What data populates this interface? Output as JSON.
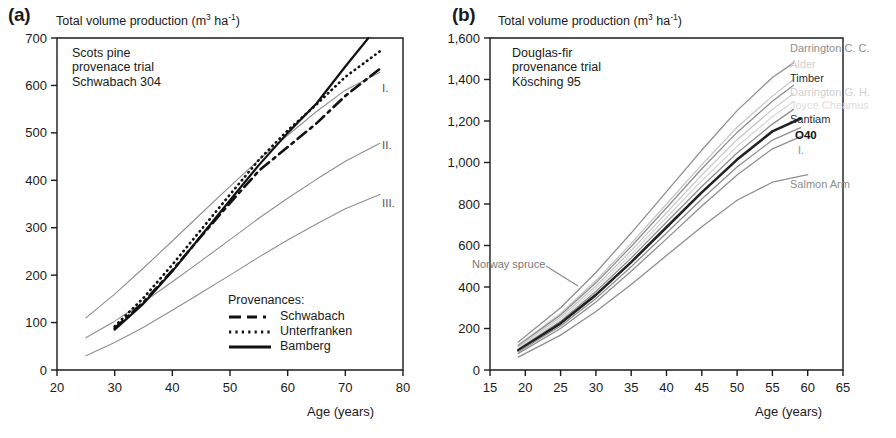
{
  "figure": {
    "background": "#ffffff",
    "axis_color": "#1a1a1a",
    "grey_series_color": "#9a9a9a",
    "dark_series_color": "#1a1a1a"
  },
  "panel_a": {
    "letter": "(a)",
    "axis_title_prefix": "Total volume production (m",
    "axis_title_sup1": "3",
    "axis_title_mid": " ha",
    "axis_title_sup2": "-1",
    "axis_title_suffix": ")",
    "note": "Scots pine\nprovenace trial\nSchwabach 304",
    "xlabel": "Age (years)",
    "yticks": [
      "0",
      "100",
      "200",
      "300",
      "400",
      "500",
      "600",
      "700"
    ],
    "xticks": [
      "20",
      "30",
      "40",
      "50",
      "60",
      "70",
      "80"
    ],
    "yield_class_labels": [
      "I.",
      "II.",
      "III."
    ],
    "legend": {
      "title": "Provenances:",
      "items": [
        {
          "label": "Schwabach",
          "style": "dashdot"
        },
        {
          "label": "Unterfranken",
          "style": "dotted"
        },
        {
          "label": "Bamberg",
          "style": "solid"
        }
      ]
    },
    "chart_data": {
      "type": "line",
      "title": "Scots pine provenace trial Schwabach 304",
      "xlabel": "Age (years)",
      "ylabel": "Total volume production (m3 ha-1)",
      "xlim": [
        20,
        80
      ],
      "ylim": [
        0,
        700
      ],
      "xticks": [
        20,
        30,
        40,
        50,
        60,
        70,
        80
      ],
      "yticks": [
        0,
        100,
        200,
        300,
        400,
        500,
        600,
        700
      ],
      "grid": false,
      "legend_position": "inside-bottom-right",
      "series": [
        {
          "name": "Yield class I.",
          "style": "thin-grey",
          "x": [
            25,
            30,
            35,
            40,
            45,
            50,
            55,
            60,
            65,
            70,
            76
          ],
          "y": [
            110,
            160,
            215,
            272,
            330,
            387,
            443,
            495,
            545,
            590,
            628
          ]
        },
        {
          "name": "Yield class II.",
          "style": "thin-grey",
          "x": [
            25,
            30,
            35,
            40,
            45,
            50,
            55,
            60,
            65,
            70,
            76
          ],
          "y": [
            68,
            103,
            143,
            186,
            230,
            275,
            320,
            362,
            402,
            440,
            478
          ]
        },
        {
          "name": "Yield class III.",
          "style": "thin-grey",
          "x": [
            25,
            30,
            35,
            40,
            45,
            50,
            55,
            60,
            65,
            70,
            76
          ],
          "y": [
            30,
            58,
            90,
            126,
            163,
            200,
            238,
            274,
            308,
            340,
            370
          ]
        },
        {
          "name": "Schwabach",
          "style": "dashdot",
          "x": [
            30,
            35,
            40,
            45,
            50,
            55,
            60,
            65,
            70,
            76
          ],
          "y": [
            88,
            143,
            210,
            282,
            352,
            420,
            470,
            520,
            578,
            635
          ]
        },
        {
          "name": "Unterfranken",
          "style": "dotted",
          "x": [
            30,
            35,
            40,
            45,
            50,
            55,
            60,
            65,
            70,
            76
          ],
          "y": [
            92,
            152,
            222,
            296,
            370,
            443,
            505,
            560,
            618,
            672
          ]
        },
        {
          "name": "Bamberg",
          "style": "solid",
          "x": [
            30,
            35,
            40,
            45,
            50,
            55,
            60,
            65,
            70,
            74
          ],
          "y": [
            85,
            140,
            208,
            283,
            358,
            432,
            500,
            562,
            640,
            700
          ]
        }
      ]
    }
  },
  "panel_b": {
    "letter": "(b)",
    "axis_title_prefix": "Total volume production (m",
    "axis_title_sup1": "3",
    "axis_title_mid": " ha",
    "axis_title_sup2": "-1",
    "axis_title_suffix": ")",
    "note": "Douglas-fir\nprovenance trial\nKösching 95",
    "xlabel": "Age (years)",
    "yticks": [
      "0",
      "200",
      "400",
      "600",
      "800",
      "1,000",
      "1,200",
      "1,400",
      "1,600"
    ],
    "xticks": [
      "15",
      "20",
      "25",
      "30",
      "35",
      "40",
      "45",
      "50",
      "55",
      "60",
      "65"
    ],
    "callout": "Norway spruce",
    "series_labels": [
      {
        "text": "Darrington C. C.",
        "tone": "grey"
      },
      {
        "text": "Alder",
        "tone": "faint"
      },
      {
        "text": "Timber",
        "tone": "dark"
      },
      {
        "text": "Darrington G. H.",
        "tone": "faint"
      },
      {
        "text": "Joyce Cheamus",
        "tone": "faint2"
      },
      {
        "text": "Santiam",
        "tone": "dark"
      },
      {
        "text": "O40",
        "tone": "bold"
      },
      {
        "text": "I.",
        "tone": "grey"
      },
      {
        "text": "Salmon Arm",
        "tone": "grey"
      }
    ],
    "chart_data": {
      "type": "line",
      "title": "Douglas-fir provenance trial Kösching 95",
      "xlabel": "Age (years)",
      "ylabel": "Total volume production (m3 ha-1)",
      "xlim": [
        15,
        65
      ],
      "ylim": [
        0,
        1600
      ],
      "xticks": [
        15,
        20,
        25,
        30,
        35,
        40,
        45,
        50,
        55,
        60,
        65
      ],
      "yticks": [
        0,
        200,
        400,
        600,
        800,
        1000,
        1200,
        1400,
        1600
      ],
      "grid": false,
      "legend_position": "right-of-curves",
      "series": [
        {
          "name": "Darrington C. C.",
          "style": "grey",
          "x": [
            19,
            25,
            30,
            35,
            40,
            45,
            50,
            55,
            58
          ],
          "y": [
            135,
            300,
            470,
            660,
            860,
            1060,
            1250,
            1410,
            1480
          ]
        },
        {
          "name": "Alder",
          "style": "faint",
          "x": [
            19,
            25,
            30,
            35,
            40,
            45,
            50,
            55,
            58
          ],
          "y": [
            120,
            272,
            430,
            610,
            800,
            990,
            1170,
            1320,
            1400
          ]
        },
        {
          "name": "Timber",
          "style": "grey",
          "x": [
            19,
            25,
            30,
            35,
            40,
            45,
            50,
            55,
            58
          ],
          "y": [
            118,
            265,
            420,
            595,
            782,
            970,
            1145,
            1295,
            1372
          ]
        },
        {
          "name": "Darrington G. H.",
          "style": "faint",
          "x": [
            19,
            25,
            30,
            35,
            40,
            45,
            50,
            55,
            58
          ],
          "y": [
            112,
            255,
            405,
            575,
            757,
            940,
            1110,
            1256,
            1332
          ]
        },
        {
          "name": "Joyce Cheamus",
          "style": "faint2",
          "x": [
            19,
            25,
            30,
            35,
            40,
            45,
            50,
            55,
            58
          ],
          "y": [
            105,
            245,
            392,
            558,
            735,
            912,
            1078,
            1220,
            1294
          ]
        },
        {
          "name": "Santiam",
          "style": "grey",
          "x": [
            19,
            25,
            30,
            35,
            40,
            45,
            50,
            55,
            58
          ],
          "y": [
            100,
            235,
            378,
            540,
            712,
            884,
            1046,
            1185,
            1256
          ]
        },
        {
          "name": "O40",
          "style": "bold-dark",
          "x": [
            19,
            25,
            30,
            35,
            40,
            45,
            50,
            55,
            59
          ],
          "y": [
            95,
            225,
            362,
            520,
            688,
            856,
            1014,
            1150,
            1212
          ]
        },
        {
          "name": "I.",
          "style": "grey",
          "x": [
            19,
            25,
            30,
            35,
            40,
            45,
            50,
            55,
            59
          ],
          "y": [
            88,
            212,
            345,
            498,
            660,
            824,
            978,
            1108,
            1168
          ]
        },
        {
          "name": "Norway spruce",
          "style": "grey",
          "x": [
            19,
            25,
            30,
            35,
            40,
            45,
            50,
            55,
            59
          ],
          "y": [
            80,
            200,
            328,
            476,
            632,
            790,
            940,
            1066,
            1125
          ]
        },
        {
          "name": "Salmon Arm",
          "style": "grey",
          "x": [
            19,
            25,
            30,
            35,
            40,
            45,
            50,
            55,
            60
          ],
          "y": [
            62,
            168,
            282,
            412,
            552,
            690,
            818,
            905,
            942
          ]
        }
      ]
    }
  }
}
